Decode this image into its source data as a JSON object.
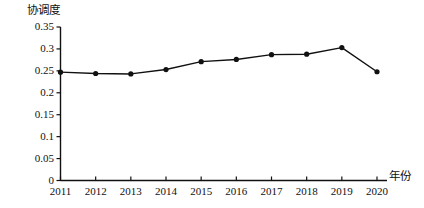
{
  "chart_data": {
    "type": "line",
    "title": "",
    "xlabel": "年份",
    "ylabel": "协调度",
    "categories": [
      "2011",
      "2012",
      "2013",
      "2014",
      "2015",
      "2016",
      "2017",
      "2018",
      "2019",
      "2020"
    ],
    "x": [
      2011,
      2012,
      2013,
      2014,
      2015,
      2016,
      2017,
      2018,
      2019,
      2020
    ],
    "values": [
      0.247,
      0.244,
      0.243,
      0.253,
      0.271,
      0.276,
      0.287,
      0.288,
      0.303,
      0.248
    ],
    "series": [
      {
        "name": "协调度",
        "values": [
          0.247,
          0.244,
          0.243,
          0.253,
          0.271,
          0.276,
          0.287,
          0.288,
          0.303,
          0.248
        ]
      }
    ],
    "ylim": [
      0,
      0.35
    ],
    "xlim": [
      2011,
      2020
    ],
    "ytick_labels": [
      "0",
      "0.05",
      "0.1",
      "0.15",
      "0.2",
      "0.25",
      "0.3",
      "0.35"
    ],
    "ytick_values": [
      0,
      0.05,
      0.1,
      0.15,
      0.2,
      0.25,
      0.3,
      0.35
    ],
    "xtick_labels": [
      "2011",
      "2012",
      "2013",
      "2014",
      "2015",
      "2016",
      "2017",
      "2018",
      "2019",
      "2020"
    ],
    "grid": false,
    "legend": "none",
    "line_color": "#111111",
    "marker": "filled-circle",
    "marker_color": "#111111"
  },
  "axes": {
    "y_title": "协调度",
    "x_title": "年份"
  }
}
